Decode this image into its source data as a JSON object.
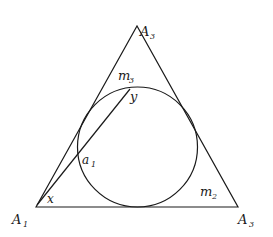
{
  "figure": {
    "stroke_color": "#1a1a1a",
    "background": "#ffffff",
    "triangle": {
      "vertices": {
        "A1": [
          36,
          207
        ],
        "A2": [
          137,
          26
        ],
        "A3": [
          238,
          207
        ]
      }
    },
    "incircle": {
      "cx": 137.5,
      "cy": 147,
      "r": 60
    },
    "chord": {
      "from": [
        37,
        205
      ],
      "to": [
        130,
        89
      ]
    },
    "labels": {
      "vertex_top": {
        "main": "A",
        "sub": "3"
      },
      "vertex_left": {
        "main": "A",
        "sub": "1"
      },
      "vertex_right": {
        "main": "A",
        "sub": "3"
      },
      "m3": {
        "main": "m",
        "sub": "3"
      },
      "m2": {
        "main": "m",
        "sub": "2"
      },
      "a1": {
        "main": "a",
        "sub": "1"
      },
      "x": "x",
      "y": "y"
    }
  }
}
